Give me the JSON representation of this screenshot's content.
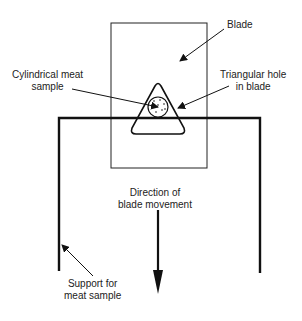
{
  "diagram": {
    "labels": {
      "blade": "Blade",
      "meat_sample_line1": "Cylindrical meat",
      "meat_sample_line2": "sample",
      "hole_line1": "Triangular hole",
      "hole_line2": "in blade",
      "direction_line1": "Direction of",
      "direction_line2": "blade movement",
      "support_line1": "Support for",
      "support_line2": "meat sample"
    },
    "colors": {
      "stroke": "#111111",
      "background": "#ffffff"
    }
  }
}
